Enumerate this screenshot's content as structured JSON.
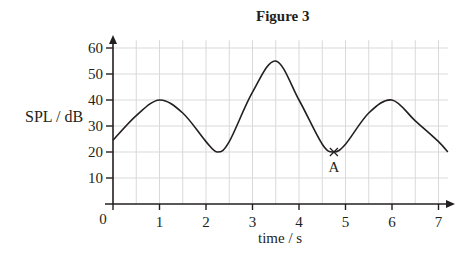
{
  "chart_data": {
    "type": "line",
    "title": "Figure 3",
    "xlabel": "time / s",
    "ylabel": "SPL / dB",
    "xlim": [
      0,
      7.2
    ],
    "ylim": [
      0,
      65
    ],
    "x_ticks": [
      0,
      1,
      2,
      3,
      4,
      5,
      6,
      7
    ],
    "y_ticks": [
      10,
      20,
      30,
      40,
      50,
      60
    ],
    "origin_label": "0",
    "grid": true,
    "grid_x_step": 0.5,
    "grid_y_step": 10,
    "series": [
      {
        "name": "SPL",
        "x": [
          0,
          0.5,
          1.0,
          1.5,
          2.0,
          2.25,
          2.5,
          3.0,
          3.5,
          4.0,
          4.5,
          4.75,
          5.0,
          5.5,
          6.0,
          6.5,
          7.0,
          7.2
        ],
        "values": [
          24.5,
          34,
          40,
          35,
          24,
          20,
          24,
          43,
          55,
          40,
          23,
          20,
          23,
          35,
          40,
          32,
          24,
          20
        ]
      }
    ],
    "annotations": [
      {
        "label": "A",
        "x": 4.75,
        "y": 20,
        "marker": "x"
      }
    ],
    "colors": {
      "line": "#231f20",
      "grid": "#d9d9d9",
      "axis": "#231f20"
    }
  },
  "labels": {
    "title": "Figure 3",
    "ylabel": "SPL / dB",
    "xlabel": "time / s"
  }
}
